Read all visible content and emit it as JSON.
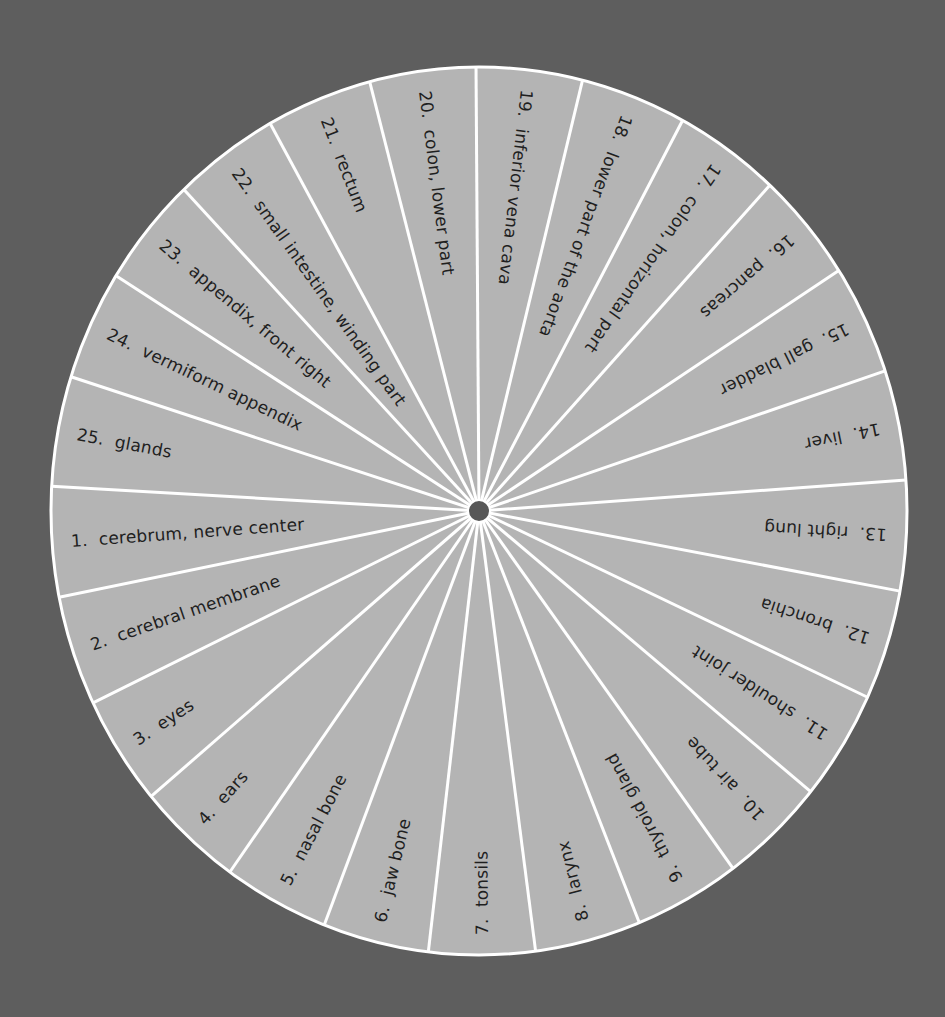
{
  "diagram": {
    "type": "radial wheel",
    "segment_count": 25,
    "colors": {
      "background": "#5e5e5e",
      "disc": "#b4b4b4",
      "dividers": "#ffffff",
      "hub": "#585858",
      "text": "#1f1f1f"
    },
    "geometry": {
      "cx": 479,
      "cy": 511,
      "rx": 428,
      "ry": 444,
      "hub_radius": 11,
      "first_boundary_deg": 183.2,
      "step_deg": 14.4,
      "label_start_radius_ratio": 0.955
    },
    "segments": [
      {
        "num": "1.",
        "label": "cerebrum, nerve center"
      },
      {
        "num": "2.",
        "label": "cerebral membrane"
      },
      {
        "num": "3.",
        "label": "eyes"
      },
      {
        "num": "4.",
        "label": "ears"
      },
      {
        "num": "5.",
        "label": "nasal bone"
      },
      {
        "num": "6.",
        "label": "jaw bone"
      },
      {
        "num": "7.",
        "label": "tonsils"
      },
      {
        "num": "8.",
        "label": "larynx"
      },
      {
        "num": "9.",
        "label": "thyroid gland"
      },
      {
        "num": "10.",
        "label": "air tube"
      },
      {
        "num": "11.",
        "label": "shoulder joint"
      },
      {
        "num": "12.",
        "label": "bronchia"
      },
      {
        "num": "13.",
        "label": "right lung"
      },
      {
        "num": "14.",
        "label": "liver"
      },
      {
        "num": "15.",
        "label": "gall bladder"
      },
      {
        "num": "16.",
        "label": "pancreas"
      },
      {
        "num": "17.",
        "label": "colon, horizontal part"
      },
      {
        "num": "18.",
        "label": "lower part of the aorta"
      },
      {
        "num": "19.",
        "label": "inferior vena cava"
      },
      {
        "num": "20.",
        "label": "colon, lower part"
      },
      {
        "num": "21.",
        "label": "rectum"
      },
      {
        "num": "22.",
        "label": "small intestine, winding part"
      },
      {
        "num": "23.",
        "label": "appendix, front right"
      },
      {
        "num": "24.",
        "label": "vermiform appendix"
      },
      {
        "num": "25.",
        "label": "glands"
      }
    ]
  }
}
